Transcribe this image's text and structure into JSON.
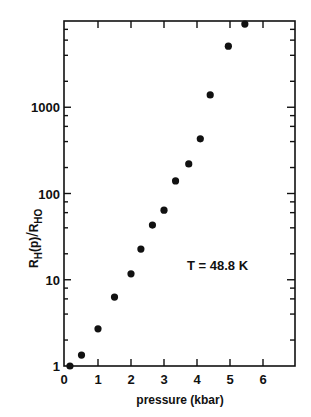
{
  "chart_data": {
    "type": "scatter",
    "title": "",
    "xlabel": "pressure (kbar)",
    "ylabel": "R_H(p)/R_HO",
    "ylabel_parts": {
      "num_main": "R",
      "num_sub": "H",
      "num_arg": "(p)",
      "den_main": "R",
      "den_sub": "HO"
    },
    "yscale": "log",
    "xlim": [
      0,
      7
    ],
    "ylim": [
      1,
      10000
    ],
    "x_ticks": [
      0,
      1,
      2,
      3,
      4,
      5,
      6
    ],
    "x_tick_labels": [
      "0",
      "1",
      "2",
      "3",
      "4",
      "5",
      "6"
    ],
    "y_ticks": [
      1,
      10,
      100,
      1000
    ],
    "y_tick_labels": [
      "1",
      "10",
      "100",
      "1000"
    ],
    "grid": false,
    "legend": null,
    "annotations": [
      {
        "text": "T = 48.8 K",
        "x": 4.0,
        "y": 12
      }
    ],
    "series": [
      {
        "name": "T = 48.8 K",
        "marker": "filled-circle",
        "color": "#111111",
        "x": [
          0.15,
          0.5,
          1.0,
          1.5,
          2.0,
          2.3,
          2.65,
          3.0,
          3.35,
          3.75,
          4.1,
          4.4,
          4.95,
          5.45
        ],
        "y": [
          1.0,
          1.34,
          2.7,
          6.3,
          11.7,
          22.7,
          43,
          64,
          140,
          220,
          430,
          1390,
          5100,
          9200
        ]
      }
    ]
  }
}
